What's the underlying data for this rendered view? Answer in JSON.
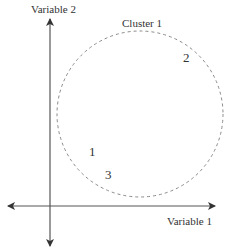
{
  "diagram": {
    "type": "cluster-scatter",
    "axes": {
      "x_label": "Variable 1",
      "y_label": "Variable 2",
      "color": "#444444"
    },
    "cluster": {
      "label": "Cluster 1",
      "border_style": "dashed",
      "color": "#888888"
    },
    "points": [
      {
        "label": "1"
      },
      {
        "label": "2"
      },
      {
        "label": "3"
      }
    ]
  }
}
